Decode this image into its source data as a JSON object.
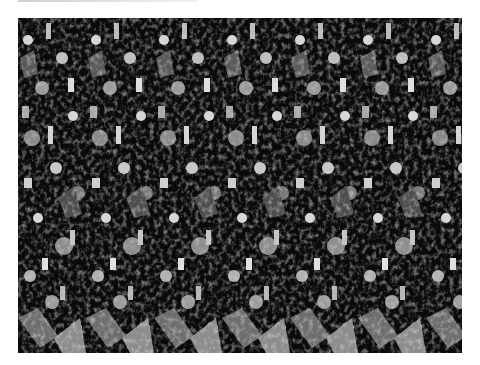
{
  "image": {
    "kind": "autostereogram",
    "alt": "Grayscale autostereogram (magic eye) with repeating cluttered pattern",
    "pattern_period_px": 68,
    "colors": {
      "background": "#0a0a0a",
      "mid": "#6e6e6e",
      "light": "#d8d8d8",
      "page": "#ffffff"
    }
  }
}
